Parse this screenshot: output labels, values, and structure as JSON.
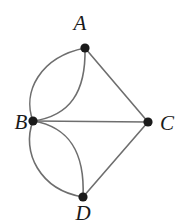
{
  "figure": {
    "kind": "undirected-multigraph-diagram",
    "width": 185,
    "height": 221,
    "background_color": "#ffffff",
    "edge_color": "#6e6e6e",
    "edge_width": 1.6,
    "vertex_color": "#1a1a1a",
    "vertex_radius": 4.6,
    "label_color": "#1a1a1a"
  },
  "vertices": [
    {
      "id": "A",
      "label": "A",
      "cx": 85,
      "cy": 48,
      "label_x": 80,
      "label_y": 30,
      "label_anchor": "middle"
    },
    {
      "id": "B",
      "label": "B",
      "cx": 33,
      "cy": 121,
      "label_x": 21,
      "label_y": 129,
      "label_anchor": "middle"
    },
    {
      "id": "C",
      "label": "C",
      "cx": 148,
      "cy": 122,
      "label_x": 167,
      "label_y": 130,
      "label_anchor": "middle"
    },
    {
      "id": "D",
      "label": "D",
      "cx": 83,
      "cy": 197,
      "label_x": 83,
      "label_y": 220,
      "label_anchor": "middle"
    }
  ],
  "edges": [
    {
      "id": "B-A-outer",
      "from": "B",
      "to": "A",
      "shape": "curve",
      "bulge": "left",
      "path": "M 33 121 C 22 92 40 57 85 48"
    },
    {
      "id": "B-A-inner",
      "from": "B",
      "to": "A",
      "shape": "curve",
      "bulge": "right",
      "path": "M 33 121 C 70 116 86 92 85 48"
    },
    {
      "id": "B-D-outer",
      "from": "B",
      "to": "D",
      "shape": "curve",
      "bulge": "left",
      "path": "M 33 121 C 21 152 40 190 83 197"
    },
    {
      "id": "B-D-inner",
      "from": "B",
      "to": "D",
      "shape": "curve",
      "bulge": "right",
      "path": "M 33 121 C 70 127 85 153 83 197"
    },
    {
      "id": "B-C",
      "from": "B",
      "to": "C",
      "shape": "line",
      "path": "M 33 121 L 148 122"
    },
    {
      "id": "A-C",
      "from": "A",
      "to": "C",
      "shape": "line",
      "path": "M 85 48 L 148 122"
    },
    {
      "id": "D-C",
      "from": "D",
      "to": "C",
      "shape": "line",
      "path": "M 83 197 L 148 122"
    }
  ]
}
